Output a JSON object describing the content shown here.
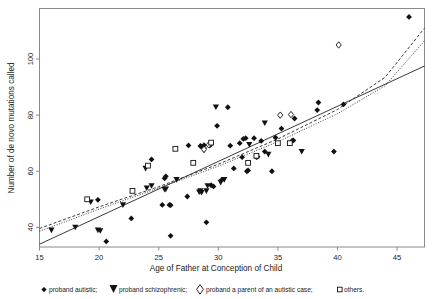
{
  "chart_data": {
    "type": "scatter",
    "title": "",
    "xlabel": "Age of Father at Conception of Child",
    "ylabel": "Number of de novo  mutations called",
    "xlim": [
      15,
      47.3
    ],
    "ylim": [
      33,
      118
    ],
    "xticks": [
      15,
      20,
      25,
      30,
      35,
      40,
      45
    ],
    "yticks": [
      40,
      60,
      80,
      100
    ],
    "grid": false,
    "legend_position": "below-axis",
    "legend": [
      {
        "marker": "filled-diamond",
        "label": "proband autistic;"
      },
      {
        "marker": "filled-triangle-down",
        "label": "proband schizophrenic;"
      },
      {
        "marker": "open-diamond",
        "label": "proband a parent of an autistic case;"
      },
      {
        "marker": "open-square",
        "label": "others."
      }
    ],
    "series": [
      {
        "name": "proband autistic",
        "marker": "filled-diamond",
        "points": [
          [
            19.9,
            49.8
          ],
          [
            20.6,
            35.0
          ],
          [
            22.7,
            43.2
          ],
          [
            24.4,
            64.2
          ],
          [
            25.3,
            48.0
          ],
          [
            25.5,
            57.5
          ],
          [
            25.6,
            58.2
          ],
          [
            25.9,
            48.0
          ],
          [
            26.0,
            47.9
          ],
          [
            26.0,
            37.0
          ],
          [
            27.4,
            51.0
          ],
          [
            27.5,
            69.2
          ],
          [
            28.5,
            69.0
          ],
          [
            28.6,
            68.8
          ],
          [
            28.8,
            69.3
          ],
          [
            29.0,
            41.8
          ],
          [
            29.3,
            69.2
          ],
          [
            29.4,
            55.0
          ],
          [
            29.6,
            54.6
          ],
          [
            29.9,
            76.2
          ],
          [
            30.3,
            57.0
          ],
          [
            30.8,
            82.8
          ],
          [
            31.0,
            69.1
          ],
          [
            31.3,
            61.0
          ],
          [
            31.8,
            70.0
          ],
          [
            32.0,
            65.0
          ],
          [
            32.1,
            71.5
          ],
          [
            32.3,
            71.8
          ],
          [
            32.4,
            60.0
          ],
          [
            32.5,
            60.3
          ],
          [
            33.0,
            71.8
          ],
          [
            33.2,
            65.0
          ],
          [
            33.3,
            65.2
          ],
          [
            33.6,
            70.8
          ],
          [
            33.9,
            67.0
          ],
          [
            34.5,
            60.0
          ],
          [
            34.8,
            72.0
          ],
          [
            35.3,
            75.2
          ],
          [
            36.2,
            70.9
          ],
          [
            36.3,
            71.0
          ],
          [
            36.4,
            78.8
          ],
          [
            38.3,
            81.8
          ],
          [
            38.4,
            84.5
          ],
          [
            39.7,
            67.0
          ],
          [
            40.5,
            83.8
          ],
          [
            46.0,
            115.0
          ]
        ]
      },
      {
        "name": "proband schizophrenic",
        "marker": "filled-triangle-down",
        "points": [
          [
            16.0,
            39.0
          ],
          [
            18.0,
            40.0
          ],
          [
            19.3,
            49.0
          ],
          [
            19.9,
            39.0
          ],
          [
            20.1,
            38.8
          ],
          [
            22.0,
            48.0
          ],
          [
            23.9,
            61.0
          ],
          [
            24.0,
            54.0
          ],
          [
            24.4,
            54.8
          ],
          [
            25.5,
            53.5
          ],
          [
            25.6,
            53.6
          ],
          [
            26.5,
            57.0
          ],
          [
            28.4,
            52.6
          ],
          [
            28.5,
            53.0
          ],
          [
            28.6,
            52.4
          ],
          [
            28.8,
            67.5
          ],
          [
            29.0,
            53.0
          ],
          [
            29.1,
            54.8
          ],
          [
            29.8,
            82.9
          ],
          [
            30.2,
            56.0
          ],
          [
            30.5,
            57.0
          ],
          [
            32.6,
            69.5
          ],
          [
            33.9,
            77.2
          ],
          [
            34.2,
            66.0
          ],
          [
            37.0,
            67.0
          ]
        ]
      },
      {
        "name": "proband a parent of an autistic case",
        "marker": "open-diamond",
        "points": [
          [
            28.8,
            67.8
          ],
          [
            29.2,
            69.4
          ],
          [
            35.2,
            80.0
          ],
          [
            36.1,
            80.2
          ],
          [
            40.1,
            105.0
          ]
        ]
      },
      {
        "name": "others",
        "marker": "open-square",
        "points": [
          [
            19.0,
            50.0
          ],
          [
            22.8,
            53.0
          ],
          [
            24.1,
            62.0
          ],
          [
            26.4,
            68.0
          ],
          [
            27.9,
            63.0
          ],
          [
            29.4,
            70.2
          ],
          [
            32.5,
            63.0
          ],
          [
            33.2,
            65.5
          ],
          [
            35.0,
            70.0
          ],
          [
            36.0,
            70.0
          ]
        ]
      }
    ],
    "fit_lines": [
      {
        "name": "linear-fit",
        "style": "solid",
        "endpoints": [
          [
            15,
            34.0
          ],
          [
            47.3,
            97.5
          ]
        ]
      },
      {
        "name": "upper-fit",
        "style": "dashed",
        "curve": [
          [
            15,
            39.6
          ],
          [
            20,
            47.3
          ],
          [
            25,
            54.5
          ],
          [
            30,
            62.5
          ],
          [
            35,
            71.5
          ],
          [
            40,
            82.0
          ],
          [
            44,
            93.5
          ],
          [
            47.3,
            111.0
          ]
        ]
      },
      {
        "name": "lower-fit",
        "style": "dotted",
        "curve": [
          [
            15,
            38.6
          ],
          [
            20,
            46.5
          ],
          [
            25,
            54.0
          ],
          [
            30,
            61.8
          ],
          [
            35,
            70.5
          ],
          [
            40,
            80.5
          ],
          [
            44,
            90.5
          ],
          [
            47.3,
            106.5
          ]
        ]
      }
    ]
  },
  "axis": {
    "xlabel": "Age of Father at Conception of Child",
    "ylabel": "Number of de novo  mutations called",
    "xticks": [
      "15",
      "20",
      "25",
      "30",
      "35",
      "40",
      "45"
    ],
    "yticks": [
      "100",
      "80",
      "60",
      "40"
    ]
  },
  "legend": {
    "autistic": "proband autistic;",
    "schizophrenic": "proband schizophrenic;",
    "parent": "proband a parent of an autistic case;",
    "others": "others."
  },
  "colors": {
    "marker": "#111111",
    "frame": "#8a8a8a",
    "line": "#3a3a3a",
    "background": "#ffffff"
  }
}
